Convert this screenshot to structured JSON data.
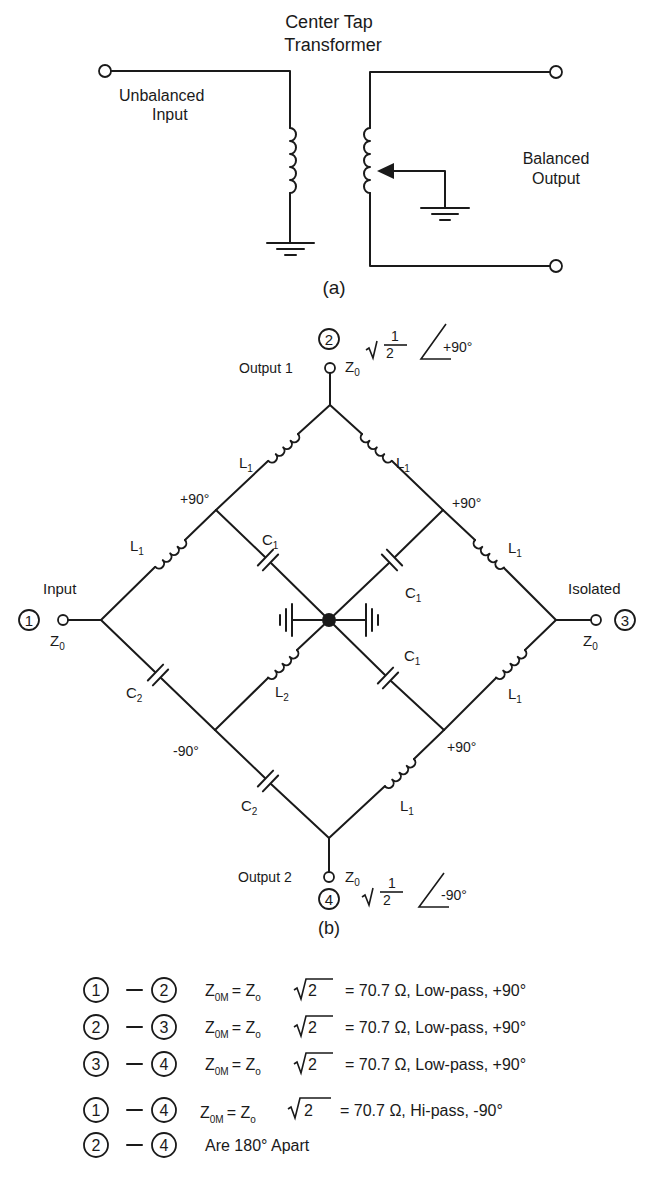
{
  "figure_a": {
    "title_line1": "Center Tap",
    "title_line2": "Transformer",
    "input_label_line1": "Unbalanced",
    "input_label_line2": "Input",
    "output_label_line1": "Balanced",
    "output_label_line2": "Output",
    "caption": "(a)"
  },
  "figure_b": {
    "caption": "(b)",
    "ports": [
      {
        "num": "1",
        "name": "Input",
        "impedance": "Z",
        "impedance_sub": "0"
      },
      {
        "num": "2",
        "name": "Output 1",
        "impedance": "Z",
        "impedance_sub": "0",
        "scale_num": "1",
        "scale_den": "2",
        "phase": "+90°"
      },
      {
        "num": "3",
        "name": "Isolated",
        "impedance": "Z",
        "impedance_sub": "0"
      },
      {
        "num": "4",
        "name": "Output 2",
        "impedance": "Z",
        "impedance_sub": "0",
        "scale_num": "1",
        "scale_den": "2",
        "phase": "-90°"
      }
    ],
    "node_phases": {
      "upper_left": "+90°",
      "upper_right": "+90°",
      "lower_left": "-90°",
      "lower_right": "+90°"
    },
    "components": {
      "L1": "L",
      "L1_sub": "1",
      "L2": "L",
      "L2_sub": "2",
      "C1": "C",
      "C1_sub": "1",
      "C2": "C",
      "C2_sub": "2"
    }
  },
  "legend": {
    "rows": [
      {
        "from": "1",
        "to": "2",
        "lhs": "Z",
        "lhs_sub": "0M",
        "mid": "= Z",
        "mid_sub": "o",
        "root": "2",
        "rest": "= 70.7 Ω, Low-pass, +90°"
      },
      {
        "from": "2",
        "to": "3",
        "lhs": "Z",
        "lhs_sub": "0M",
        "mid": "= Z",
        "mid_sub": "o",
        "root": "2",
        "rest": "= 70.7 Ω, Low-pass, +90°"
      },
      {
        "from": "3",
        "to": "4",
        "lhs": "Z",
        "lhs_sub": "0M",
        "mid": "= Z",
        "mid_sub": "o",
        "root": "2",
        "rest": "= 70.7 Ω, Low-pass, +90°"
      },
      {
        "from": "1",
        "to": "4",
        "lhs": "Z",
        "lhs_sub": "0M",
        "mid": "= Z",
        "mid_sub": "o",
        "root": "2",
        "rest": "= 70.7 Ω, Hi-pass, -90°"
      },
      {
        "from": "2",
        "to": "4",
        "text": "Are 180° Apart"
      }
    ],
    "dash": "—"
  }
}
